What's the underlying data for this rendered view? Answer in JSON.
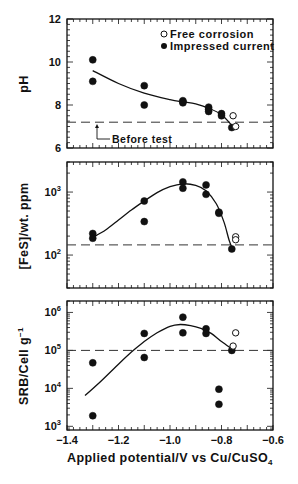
{
  "chart_data": [
    {
      "type": "scatter",
      "panel": "top",
      "title": "",
      "xlabel": "Applied potential/V vs  Cu/CuSO4",
      "ylabel": "pH",
      "yscale": "linear",
      "xlim": [
        -1.4,
        -0.6
      ],
      "ylim": [
        6,
        12
      ],
      "yticks": [
        6,
        8,
        10,
        12
      ],
      "ytick_labels": [
        "6",
        "8",
        "10",
        "12"
      ],
      "grid": false,
      "legend": {
        "position": "upper right",
        "entries": [
          {
            "marker": "open-circle",
            "label": "Free corrosion"
          },
          {
            "marker": "filled-circle",
            "label": "Impressed current"
          }
        ]
      },
      "series": [
        {
          "name": "Impressed current",
          "marker": "filled-circle",
          "points": [
            [
              -1.3,
              10.1
            ],
            [
              -1.3,
              9.1
            ],
            [
              -1.1,
              8.9
            ],
            [
              -1.1,
              8.0
            ],
            [
              -0.95,
              8.2
            ],
            [
              -0.95,
              8.15
            ],
            [
              -0.95,
              8.1
            ],
            [
              -0.85,
              7.9
            ],
            [
              -0.85,
              7.8
            ],
            [
              -0.85,
              7.7
            ],
            [
              -0.8,
              7.6
            ],
            [
              -0.8,
              7.5
            ],
            [
              -0.76,
              6.95
            ]
          ]
        },
        {
          "name": "Free corrosion",
          "marker": "open-circle",
          "points": [
            [
              -0.755,
              7.5
            ],
            [
              -0.745,
              7.0
            ]
          ]
        }
      ],
      "fit_curve": [
        [
          -1.3,
          9.6
        ],
        [
          -1.2,
          9.0
        ],
        [
          -1.1,
          8.55
        ],
        [
          -1.0,
          8.25
        ],
        [
          -0.95,
          8.15
        ],
        [
          -0.9,
          8.05
        ],
        [
          -0.85,
          7.85
        ],
        [
          -0.8,
          7.55
        ],
        [
          -0.76,
          7.05
        ]
      ],
      "reference_line": {
        "y": 7.2,
        "style": "dashed"
      },
      "annotation": {
        "text": "Before test",
        "arrow_to": [
          -1.3,
          7.2
        ]
      }
    },
    {
      "type": "scatter",
      "panel": "middle",
      "xlabel": "Applied potential/V vs  Cu/CuSO4",
      "ylabel": "[FeS]/wt. ppm",
      "yscale": "log",
      "xlim": [
        -1.4,
        -0.6
      ],
      "ylim": [
        30,
        3000
      ],
      "yticks": [
        100,
        1000
      ],
      "ytick_labels": [
        "10^2",
        "10^3"
      ],
      "grid": false,
      "series": [
        {
          "name": "Impressed current",
          "marker": "filled-circle",
          "points": [
            [
              -1.3,
              220
            ],
            [
              -1.3,
              185
            ],
            [
              -1.1,
              720
            ],
            [
              -1.1,
              340
            ],
            [
              -0.95,
              1450
            ],
            [
              -0.95,
              1150
            ],
            [
              -0.86,
              1300
            ],
            [
              -0.86,
              920
            ],
            [
              -0.81,
              480
            ],
            [
              -0.81,
              460
            ],
            [
              -0.76,
              125
            ]
          ]
        },
        {
          "name": "Free corrosion",
          "marker": "open-circle",
          "points": [
            [
              -0.745,
              195
            ],
            [
              -0.745,
              175
            ]
          ]
        }
      ],
      "fit_curve": [
        [
          -1.3,
          190
        ],
        [
          -1.25,
          250
        ],
        [
          -1.2,
          360
        ],
        [
          -1.15,
          520
        ],
        [
          -1.1,
          720
        ],
        [
          -1.05,
          980
        ],
        [
          -1.0,
          1220
        ],
        [
          -0.95,
          1350
        ],
        [
          -0.9,
          1280
        ],
        [
          -0.86,
          1050
        ],
        [
          -0.82,
          650
        ],
        [
          -0.79,
          330
        ],
        [
          -0.77,
          170
        ],
        [
          -0.755,
          120
        ]
      ],
      "reference_line": {
        "y": 145,
        "style": "dashed"
      }
    },
    {
      "type": "scatter",
      "panel": "bottom",
      "xlabel": "Applied potential/V vs  Cu/CuSO4",
      "ylabel": "SRB/Cell g^-1",
      "yscale": "log",
      "xlim": [
        -1.4,
        -0.6
      ],
      "ylim": [
        800,
        2000000
      ],
      "yticks": [
        1000,
        10000,
        100000,
        1000000
      ],
      "ytick_labels": [
        "10^3",
        "10^4",
        "10^5",
        "10^6"
      ],
      "xticks": [
        -1.4,
        -1.2,
        -1.0,
        -0.8,
        -0.6
      ],
      "xtick_labels": [
        "−1.4",
        "−1.2",
        "−1.0",
        "−0.8",
        "−0.6"
      ],
      "grid": false,
      "series": [
        {
          "name": "Impressed current",
          "marker": "filled-circle",
          "points": [
            [
              -1.3,
              47000
            ],
            [
              -1.3,
              1900
            ],
            [
              -1.1,
              280000
            ],
            [
              -1.1,
              65000
            ],
            [
              -0.95,
              750000
            ],
            [
              -0.95,
              290000
            ],
            [
              -0.86,
              370000
            ],
            [
              -0.86,
              280000
            ],
            [
              -0.81,
              9500
            ],
            [
              -0.81,
              3800
            ],
            [
              -0.76,
              100000
            ]
          ]
        },
        {
          "name": "Free corrosion",
          "marker": "open-circle",
          "points": [
            [
              -0.745,
              290000
            ],
            [
              -0.755,
              130000
            ]
          ]
        }
      ],
      "fit_curve": [
        [
          -1.33,
          6500
        ],
        [
          -1.28,
          13000
        ],
        [
          -1.22,
          32000
        ],
        [
          -1.15,
          90000
        ],
        [
          -1.1,
          170000
        ],
        [
          -1.05,
          290000
        ],
        [
          -1.0,
          430000
        ],
        [
          -0.96,
          480000
        ],
        [
          -0.92,
          450000
        ],
        [
          -0.88,
          380000
        ],
        [
          -0.84,
          280000
        ],
        [
          -0.8,
          170000
        ],
        [
          -0.76,
          110000
        ]
      ],
      "reference_line": {
        "y": 100000,
        "style": "dashed"
      }
    }
  ],
  "labels": {
    "panel_ylabels": [
      "pH",
      "[FeS]/wt. ppm",
      "SRB/Cell g"
    ],
    "srb_superscript": "−1",
    "xlabel_main": "Applied potential/V vs  Cu/CuSO",
    "xlabel_subscript": "4",
    "legend_free": "Free corrosion",
    "legend_impressed": "Impressed current",
    "annotation_before_test": "Before test"
  }
}
